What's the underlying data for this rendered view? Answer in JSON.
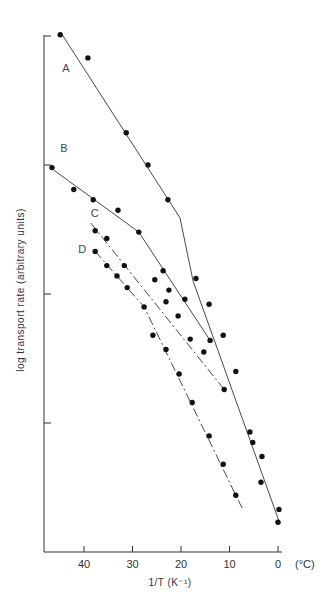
{
  "chart_data": {
    "type": "scatter",
    "title": "",
    "xlabel": "1/T (K⁻¹)",
    "xlabel_unit_note": "(°C)",
    "ylabel": "log transport rate (arbitrary units)",
    "x_axis": {
      "reversed": true,
      "ticks": [
        40,
        30,
        20,
        10,
        0
      ],
      "tick_labels": [
        "40",
        "30",
        "20",
        "10",
        "0"
      ],
      "range": [
        48.5,
        -7
      ]
    },
    "y_axis": {
      "ticks": [
        1,
        2,
        3,
        4
      ],
      "tick_labels": [
        "",
        "",
        "",
        ""
      ],
      "range": [
        0,
        4.25
      ]
    },
    "grid": false,
    "legend": "inline letters",
    "series": [
      {
        "name": "A",
        "style": "solid",
        "points": [
          [
            44.9,
            4.01
          ],
          [
            39.2,
            3.83
          ],
          [
            31.3,
            3.25
          ],
          [
            26.8,
            3.0
          ],
          [
            22.7,
            2.73
          ],
          [
            16.9,
            2.12
          ],
          [
            14.2,
            1.92
          ],
          [
            11.3,
            1.68
          ],
          [
            8.7,
            1.4
          ],
          [
            5.8,
            0.93
          ],
          [
            5.2,
            0.85
          ],
          [
            3.3,
            0.74
          ],
          [
            3.5,
            0.54
          ],
          [
            -0.2,
            0.33
          ],
          [
            0.0,
            0.23
          ]
        ],
        "line": [
          [
            44.5,
            4.01
          ],
          [
            20.2,
            2.59
          ],
          [
            17.5,
            2.1
          ],
          [
            -0.4,
            0.22
          ]
        ]
      },
      {
        "name": "B",
        "style": "solid",
        "points": [
          [
            46.6,
            2.98
          ],
          [
            42.1,
            2.81
          ],
          [
            38.1,
            2.73
          ],
          [
            33.0,
            2.65
          ],
          [
            28.7,
            2.48
          ],
          [
            23.7,
            2.18
          ],
          [
            19.2,
            1.96
          ],
          [
            14.0,
            1.64
          ]
        ],
        "line": [
          [
            46.2,
            2.96
          ],
          [
            28.7,
            2.48
          ],
          [
            14.0,
            1.64
          ]
        ]
      },
      {
        "name": "C",
        "style": "dash-dot",
        "points": [
          [
            37.7,
            2.49
          ],
          [
            35.3,
            2.43
          ],
          [
            31.7,
            2.22
          ],
          [
            25.4,
            2.11
          ],
          [
            23.1,
            1.94
          ],
          [
            22.5,
            2.03
          ],
          [
            20.6,
            1.83
          ],
          [
            18.1,
            1.65
          ],
          [
            15.3,
            1.55
          ],
          [
            11.1,
            1.26
          ]
        ],
        "line": [
          [
            38.6,
            2.55
          ],
          [
            11.1,
            1.26
          ]
        ]
      },
      {
        "name": "D",
        "style": "dash-dot",
        "points": [
          [
            37.7,
            2.33
          ],
          [
            35.3,
            2.22
          ],
          [
            33.2,
            2.14
          ],
          [
            31.1,
            2.05
          ],
          [
            27.6,
            1.9
          ],
          [
            25.8,
            1.68
          ],
          [
            23.1,
            1.57
          ],
          [
            20.4,
            1.38
          ],
          [
            17.7,
            1.16
          ],
          [
            14.2,
            0.9
          ],
          [
            11.3,
            0.68
          ],
          [
            8.7,
            0.44
          ]
        ],
        "line": [
          [
            37.7,
            2.33
          ],
          [
            27.6,
            1.9
          ],
          [
            7.4,
            0.34
          ]
        ]
      }
    ],
    "annotations": [
      {
        "text": "A",
        "x": 44.5,
        "y": 3.72
      },
      {
        "text": "B",
        "x": 44.9,
        "y": 3.1
      },
      {
        "text": "C",
        "x": 38.6,
        "y": 2.6
      },
      {
        "text": "D",
        "x": 41.2,
        "y": 2.32
      }
    ]
  }
}
